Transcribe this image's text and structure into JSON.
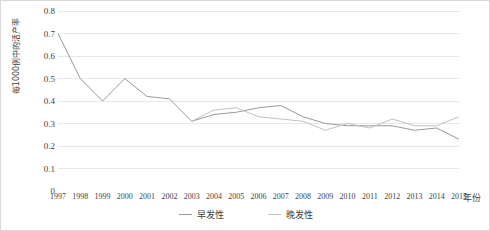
{
  "chart_data": {
    "type": "line",
    "title": "",
    "xlabel": "年份",
    "ylabel": "每1000例中的活产率",
    "x": [
      1997,
      1998,
      1999,
      2000,
      2001,
      2002,
      2003,
      2004,
      2005,
      2006,
      2007,
      2008,
      2009,
      2010,
      2011,
      2012,
      2013,
      2014,
      2015
    ],
    "categories": [
      "1997",
      "1998",
      "1999",
      "2000",
      "2001",
      "2002",
      "2003",
      "2004",
      "2005",
      "2006",
      "2007",
      "2008",
      "2009",
      "2010",
      "2011",
      "2012",
      "2013",
      "2014",
      "2015"
    ],
    "ylim": [
      0,
      0.8
    ],
    "yticks": [
      "0",
      "0.1",
      "0.2",
      "0.3",
      "0.4",
      "0.5",
      "0.6",
      "0.7",
      "0.8"
    ],
    "ytick_values": [
      0,
      0.1,
      0.2,
      0.3,
      0.4,
      0.5,
      0.6,
      0.7,
      0.8
    ],
    "grid": true,
    "legend_position": "bottom",
    "series": [
      {
        "name": "早发性",
        "color": "#9a9a9a",
        "values": [
          0.7,
          0.5,
          0.4,
          0.5,
          0.42,
          0.41,
          0.31,
          0.34,
          0.35,
          0.37,
          0.38,
          0.33,
          0.3,
          0.29,
          0.29,
          0.29,
          0.27,
          0.28,
          0.23
        ]
      },
      {
        "name": "晚发性",
        "color": "#c2c2c2",
        "values": [
          null,
          null,
          null,
          null,
          null,
          null,
          0.31,
          0.36,
          0.37,
          0.33,
          0.32,
          0.31,
          0.27,
          0.3,
          0.28,
          0.32,
          0.29,
          0.29,
          0.33
        ]
      }
    ]
  },
  "legend": {
    "items": [
      {
        "label": "早发性",
        "color": "#9a9a9a"
      },
      {
        "label": "晚发性",
        "color": "#c2c2c2"
      }
    ]
  },
  "axis": {
    "y_title": "每1000例中的活产率",
    "x_title": "年份"
  },
  "colors": {
    "grid": "#e8e8e8",
    "border": "#d9d9d9",
    "text": "#3f3f3f",
    "series_early": "#9a9a9a",
    "series_late": "#c2c2c2"
  }
}
